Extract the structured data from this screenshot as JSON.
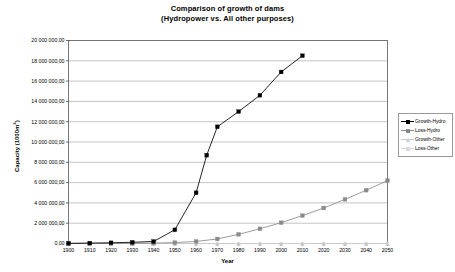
{
  "chart_data": {
    "type": "line",
    "title": "Comparison of growth of dams",
    "subtitle": "(Hydropower vs. All other purposes)",
    "xlabel": "Year",
    "ylabel": "Capacity (1000m",
    "ylabel_sup": "3",
    "ylabel_tail": ")",
    "xlim": [
      1900,
      2050
    ],
    "ylim": [
      0,
      20000000
    ],
    "grid": "horizontal",
    "legend_position": "right",
    "xticks": [
      "1900",
      "1910",
      "1920",
      "1930",
      "1940",
      "1950",
      "1960",
      "1970",
      "1980",
      "1990",
      "2000",
      "2010",
      "2020",
      "2030",
      "2040",
      "2050"
    ],
    "xtick_values": [
      1900,
      1910,
      1920,
      1930,
      1940,
      1950,
      1960,
      1970,
      1980,
      1990,
      2000,
      2010,
      2020,
      2030,
      2040,
      2050
    ],
    "yticks": [
      "0,00",
      "2 000 000,00",
      "4 000 000,00",
      "6 000 000,00",
      "8 000 000,00",
      "10 000 000,00",
      "12 000 000,00",
      "14 000 000,00",
      "16 000 000,00",
      "18 000 000,00",
      "20 000 000,00"
    ],
    "ytick_values": [
      0,
      2000000,
      4000000,
      6000000,
      8000000,
      10000000,
      12000000,
      14000000,
      16000000,
      18000000,
      20000000
    ],
    "series": [
      {
        "name": "Growth-Hydro",
        "color": "#000000",
        "marker": "diamond",
        "x": [
          1900,
          1910,
          1920,
          1930,
          1940,
          1950,
          1960,
          1965,
          1970,
          1980,
          1990,
          2000,
          2010
        ],
        "values": [
          20000,
          40000,
          70000,
          120000,
          200000,
          1350000,
          5000000,
          8700000,
          11500000,
          13000000,
          14600000,
          16900000,
          18500000
        ]
      },
      {
        "name": "Loss-Hydro",
        "color": "#8a8a8a",
        "marker": "square",
        "x": [
          1900,
          1910,
          1920,
          1930,
          1940,
          1950,
          1960,
          1970,
          1980,
          1990,
          2000,
          2010,
          2020,
          2030,
          2040,
          2050
        ],
        "values": [
          0,
          0,
          5000,
          15000,
          40000,
          90000,
          200000,
          450000,
          900000,
          1450000,
          2050000,
          2750000,
          3500000,
          4350000,
          5250000,
          6200000
        ]
      },
      {
        "name": "Growth-Other",
        "color": "#c9c9c9",
        "marker": "triangle",
        "x": [
          1900,
          1910,
          1920,
          1930,
          1940,
          1950,
          1960,
          1970,
          1980,
          1990,
          2000,
          2010,
          2020,
          2030,
          2040,
          2050
        ],
        "values": [
          0,
          0,
          0,
          0,
          0,
          0,
          0,
          0,
          0,
          0,
          0,
          0,
          0,
          0,
          0,
          0
        ]
      },
      {
        "name": "Loss-Other",
        "color": "#d9d9d9",
        "marker": "cross",
        "x": [
          1900,
          1910,
          1920,
          1930,
          1940,
          1950,
          1960,
          1970,
          1980,
          1990,
          2000,
          2010,
          2020,
          2030,
          2040,
          2050
        ],
        "values": [
          0,
          0,
          0,
          0,
          0,
          0,
          0,
          0,
          0,
          0,
          0,
          0,
          0,
          0,
          0,
          0
        ]
      }
    ]
  },
  "legend": {
    "items": [
      {
        "label": "Growth-Hydro"
      },
      {
        "label": "Loss-Hydro"
      },
      {
        "label": "Growth-Other"
      },
      {
        "label": "Loss-Other"
      }
    ]
  },
  "colors": {
    "plot_border": "#6b6b6b",
    "gridline": "#b5b5b5",
    "axis": "#4a4a4a",
    "legend_border": "#9a9a9a"
  }
}
